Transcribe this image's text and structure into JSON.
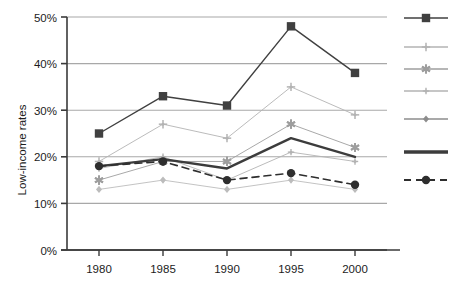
{
  "chart_data": {
    "type": "line",
    "title": "",
    "subtitle": "",
    "xlabel": "",
    "ylabel": "Low-income rates",
    "x": [
      1980,
      1985,
      1990,
      1995,
      2000
    ],
    "categories": [
      "1980",
      "1985",
      "1990",
      "1995",
      "2000"
    ],
    "xtick_labels": [
      "1980",
      "1985",
      "1990",
      "1995",
      "2000"
    ],
    "ytick_labels": [
      "0%",
      "10%",
      "20%",
      "30%",
      "40%",
      "50%"
    ],
    "ytick_values": [
      0,
      10,
      20,
      30,
      40,
      50
    ],
    "ylim": [
      0,
      50
    ],
    "xlim": [
      1977.5,
      2002.5
    ],
    "grid": true,
    "grid_axis": "y",
    "legend_position": "right",
    "legend_labels_visible": false,
    "series": [
      {
        "name": "series-1",
        "marker": "square",
        "line_style": "solid",
        "line_width": 1.4,
        "color": "#404040",
        "values": [
          25,
          33,
          31,
          48,
          38
        ]
      },
      {
        "name": "series-2",
        "marker": "thin-cross",
        "line_style": "solid",
        "line_width": 0.9,
        "color": "#b3b3b3",
        "values": [
          19,
          27,
          24,
          35,
          29
        ]
      },
      {
        "name": "series-3",
        "marker": "star",
        "line_style": "solid",
        "line_width": 0.9,
        "color": "#9e9e9e",
        "values": [
          15,
          19,
          19,
          27,
          22
        ]
      },
      {
        "name": "series-4",
        "marker": "small-cross",
        "line_style": "solid",
        "line_width": 0.9,
        "color": "#b3b3b3",
        "values": [
          17.5,
          20,
          15,
          21,
          19
        ]
      },
      {
        "name": "series-5",
        "marker": "small-diamond",
        "line_style": "solid",
        "line_width": 0.9,
        "color": "#bcbcbc",
        "values": [
          13,
          15,
          13,
          15,
          13
        ]
      },
      {
        "name": "series-6",
        "marker": "none",
        "line_style": "solid",
        "line_width": 2.4,
        "color": "#3c3c3c",
        "values": [
          18,
          19.5,
          17.5,
          24,
          20
        ]
      },
      {
        "name": "series-7",
        "marker": "circle",
        "line_style": "dashed",
        "line_width": 1.6,
        "color": "#2e2e2e",
        "values": [
          18,
          19,
          15,
          16.5,
          14
        ]
      }
    ]
  },
  "legend": {
    "entries": [
      {
        "marker": "square",
        "line_style": "solid",
        "color": "#404040",
        "label": ""
      },
      {
        "marker": "thin-cross",
        "line_style": "solid",
        "color": "#b3b3b3",
        "label": ""
      },
      {
        "marker": "star",
        "line_style": "solid",
        "color": "#9e9e9e",
        "label": ""
      },
      {
        "marker": "small-cross",
        "line_style": "solid",
        "color": "#b3b3b3",
        "label": ""
      },
      {
        "marker": "small-diamond",
        "line_style": "solid",
        "color": "#8c8c8c",
        "label": ""
      },
      {
        "marker": "none",
        "line_style": "solid",
        "color": "#3c3c3c",
        "label": ""
      },
      {
        "marker": "circle",
        "line_style": "dashed",
        "color": "#2e2e2e",
        "label": ""
      }
    ]
  },
  "colors": {
    "background": "#ffffff",
    "axis": "#3a3a3a",
    "gridline": "#a8a8a8",
    "text": "#1c1c1c"
  }
}
